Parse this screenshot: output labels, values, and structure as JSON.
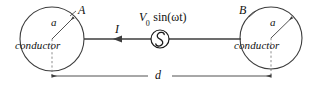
{
  "figure": {
    "type": "circuit-diagram",
    "width": 314,
    "height": 86,
    "background_color": "#ffffff",
    "line_color": "#3d3d3d",
    "text_color": "#111111"
  },
  "left_conductor": {
    "name": "left-conductor",
    "body_label": "conductor",
    "point_label": "A",
    "radius_label": "a",
    "center_x": 52,
    "center_y": 39,
    "radius": 32
  },
  "right_conductor": {
    "name": "right-conductor",
    "body_label": "conductor",
    "point_label": "B",
    "radius_label": "a",
    "center_x": 271,
    "center_y": 38,
    "radius": 31
  },
  "current": {
    "label": "I",
    "direction": "left"
  },
  "source": {
    "symbol": "ac-source",
    "label_prefix": "V",
    "label_subscript": "0",
    "label_suffix": " sin(ωt)",
    "label_plain": "V0 sin(ωt)",
    "center_x": 160,
    "center_y": 39,
    "radius": 9
  },
  "dimension": {
    "label": "d",
    "from_x": 52,
    "to_x": 271,
    "y": 76,
    "style": "double-headed-arrow"
  },
  "wires": {
    "left_segment": "from left conductor edge to source",
    "right_segment": "from source to right conductor edge",
    "y": 39
  }
}
